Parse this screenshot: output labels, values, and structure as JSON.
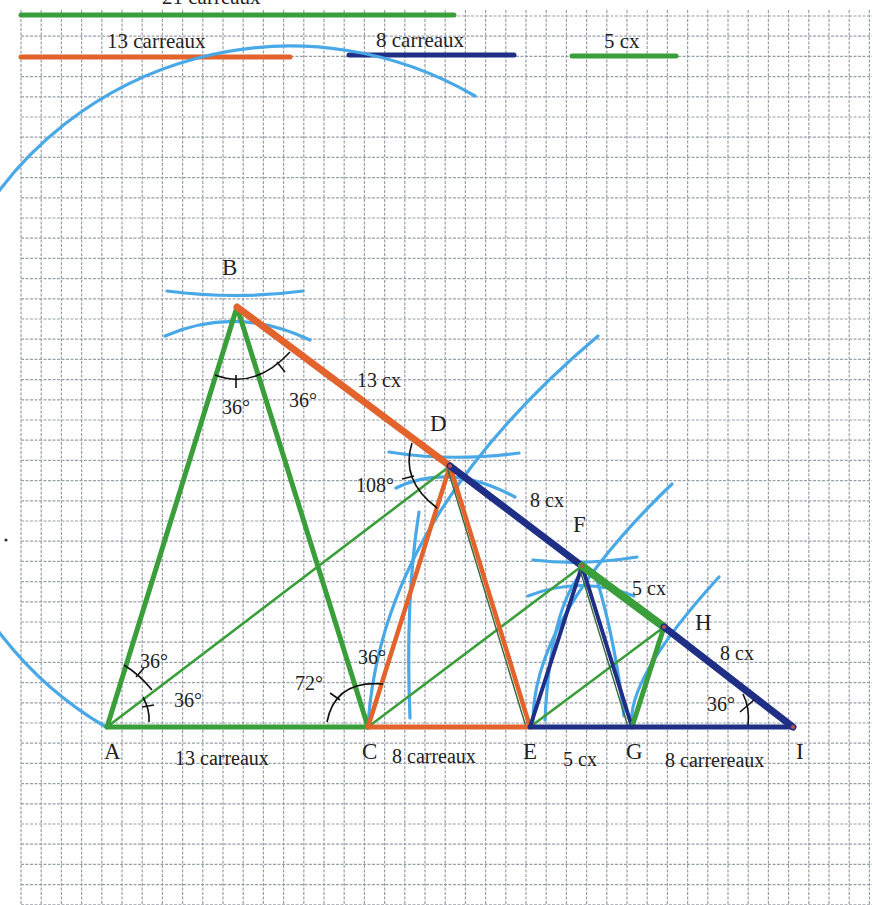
{
  "colors": {
    "grid": "#9aa0a8",
    "green": "#3a9e3a",
    "orange": "#e2632b",
    "navy": "#1f2f86",
    "arc_blue": "#49a8e6",
    "angle_mark": "#111111",
    "text": "#222222"
  },
  "legend": {
    "bar_21": {
      "label": "21 carreaux",
      "color": "green"
    },
    "bar_13": {
      "label": "13 carreaux",
      "color": "orange"
    },
    "bar_8": {
      "label": "8 carreaux",
      "color": "navy"
    },
    "bar_5": {
      "label": "5 cx",
      "color": "green"
    }
  },
  "points": {
    "A": {
      "label": "A"
    },
    "B": {
      "label": "B"
    },
    "C": {
      "label": "C"
    },
    "D": {
      "label": "D"
    },
    "E": {
      "label": "E"
    },
    "F": {
      "label": "F"
    },
    "G": {
      "label": "G"
    },
    "H": {
      "label": "H"
    },
    "I": {
      "label": "I"
    }
  },
  "segment_labels": {
    "AC": "13 carreaux",
    "CE": "8 carreaux",
    "EG": "5 cx",
    "GI": "8 carrereaux",
    "BD": "13 cx",
    "DF": "8 cx",
    "FH": "5 cx",
    "HI": "8 cx"
  },
  "angle_labels": {
    "B_left": "36°",
    "B_right": "36°",
    "A_upper": "36°",
    "A_lower": "36°",
    "C_72": "72°",
    "C_36": "36°",
    "D_108": "108°",
    "I_36": "36°"
  }
}
